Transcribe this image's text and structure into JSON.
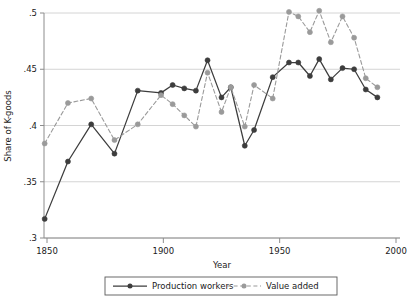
{
  "chart_data": {
    "type": "line",
    "title": "",
    "xlabel": "Year",
    "ylabel": "Share of K-goods",
    "xlim": [
      1845,
      1998
    ],
    "ylim": [
      0.3,
      0.5
    ],
    "xticks": [
      1850,
      1900,
      1950,
      2000
    ],
    "xticklabels": [
      "1850",
      "1900",
      "1950",
      "2000"
    ],
    "yticks": [
      0.3,
      0.35,
      0.4,
      0.45,
      0.5
    ],
    "yticklabels": [
      ".3",
      ".35",
      ".4",
      ".45",
      ".5"
    ],
    "grid": "horizontal",
    "legend_position": "below-axis-center",
    "series": [
      {
        "name": "Production workers",
        "color": "#3d3d3d",
        "style": "solid",
        "marker": "filled-circle",
        "x": [
          1849,
          1859,
          1869,
          1879,
          1889,
          1899,
          1904,
          1909,
          1914,
          1919,
          1925,
          1929,
          1935,
          1939,
          1947,
          1954,
          1958,
          1963,
          1967,
          1972,
          1977,
          1982,
          1987,
          1992
        ],
        "y": [
          0.317,
          0.368,
          0.401,
          0.375,
          0.431,
          0.429,
          0.436,
          0.433,
          0.431,
          0.458,
          0.425,
          0.434,
          0.382,
          0.396,
          0.443,
          0.456,
          0.456,
          0.444,
          0.459,
          0.441,
          0.451,
          0.45,
          0.432,
          0.425
        ]
      },
      {
        "name": "Value added",
        "color": "#9a9a9a",
        "style": "dashed",
        "marker": "filled-circle",
        "x": [
          1849,
          1859,
          1869,
          1879,
          1889,
          1899,
          1904,
          1909,
          1914,
          1919,
          1925,
          1929,
          1935,
          1939,
          1947,
          1954,
          1958,
          1963,
          1967,
          1972,
          1977,
          1982,
          1987,
          1992
        ],
        "y": [
          0.384,
          0.42,
          0.424,
          0.387,
          0.401,
          0.427,
          0.419,
          0.409,
          0.399,
          0.447,
          0.412,
          0.434,
          0.399,
          0.436,
          0.424,
          0.501,
          0.497,
          0.483,
          0.502,
          0.474,
          0.497,
          0.478,
          0.442,
          0.434
        ]
      }
    ]
  },
  "legend": {
    "items": [
      {
        "label": "Production workers"
      },
      {
        "label": "Value added"
      }
    ]
  },
  "axes": {
    "y_title": "Share of K-goods",
    "x_title": "Year"
  }
}
